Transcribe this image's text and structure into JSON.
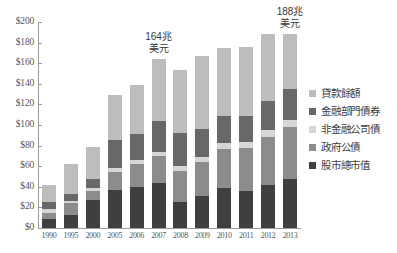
{
  "chart_data": {
    "type": "bar",
    "title": "",
    "subtitle": "",
    "xlabel": "",
    "ylabel": "",
    "stacked": true,
    "grid": false,
    "legend_position": "right",
    "ylim": [
      0,
      200
    ],
    "ytick_labels": [
      "$200",
      "$180",
      "$160",
      "$140",
      "$120",
      "$100",
      "$80",
      "$60",
      "$40",
      "$20",
      "$0"
    ],
    "ytick_values": [
      200,
      180,
      160,
      140,
      120,
      100,
      80,
      60,
      40,
      20,
      0
    ],
    "categories": [
      "1990",
      "1995",
      "2000",
      "2005",
      "2006",
      "2007",
      "2008",
      "2009",
      "2010",
      "2011",
      "2012",
      "2013"
    ],
    "series": [
      {
        "name": "股市總市值",
        "color": "#3f3f3f",
        "values": [
          9,
          13,
          27,
          37,
          40,
          44,
          25,
          31,
          39,
          36,
          42,
          48
        ]
      },
      {
        "name": "政府公債",
        "color": "#8c8c8c",
        "values": [
          6,
          11,
          9,
          17,
          22,
          26,
          30,
          33,
          38,
          42,
          46,
          50
        ]
      },
      {
        "name": "非金融公司債",
        "color": "#d6d6d6",
        "values": [
          3,
          2,
          3,
          4,
          4,
          4,
          5,
          5,
          6,
          6,
          7,
          7
        ]
      },
      {
        "name": "金融部門債券",
        "color": "#686868",
        "values": [
          7,
          7,
          9,
          27,
          25,
          30,
          32,
          27,
          26,
          25,
          28,
          30
        ]
      },
      {
        "name": "貸款餘額",
        "color": "#bdbdbd",
        "values": [
          17,
          29,
          31,
          44,
          48,
          60,
          61,
          71,
          66,
          67,
          65,
          53
        ]
      }
    ],
    "totals": [
      42,
      62,
      79,
      129,
      139,
      164,
      153,
      167,
      175,
      176,
      188,
      188
    ],
    "annotations": [
      {
        "text_line1": "164兆",
        "text_line2": "美元",
        "category": "2007"
      },
      {
        "text_line1": "188兆",
        "text_line2": "美元",
        "category": "2013"
      }
    ]
  },
  "legend": {
    "items": [
      {
        "label": "貸款餘額",
        "color": "#bdbdbd"
      },
      {
        "label": "金融部門債券",
        "color": "#686868"
      },
      {
        "label": "非金融公司債",
        "color": "#d6d6d6"
      },
      {
        "label": "政府公債",
        "color": "#8c8c8c"
      },
      {
        "label": "股市總市值",
        "color": "#3f3f3f"
      }
    ]
  },
  "colors": {
    "axis": "#9a9a9a",
    "text": "#555555",
    "background": "#ffffff"
  }
}
